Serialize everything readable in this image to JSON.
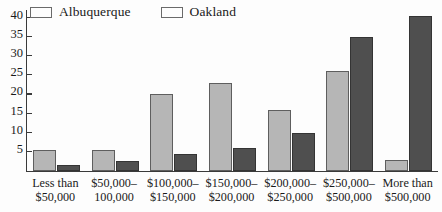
{
  "chart_data": {
    "type": "bar",
    "title": "",
    "subtitle": "",
    "xlabel": "",
    "ylabel": "",
    "ylim": [
      0,
      42
    ],
    "yticks": [
      5,
      10,
      15,
      20,
      25,
      30,
      35,
      40
    ],
    "ytick_labels": [
      "5",
      "10",
      "15",
      "20",
      "25",
      "30",
      "35",
      "40"
    ],
    "grid": false,
    "legend_position": "top-left",
    "categories": [
      "Less than\n$50,000",
      "$50,000–\n100,000",
      "$100,000–\n$150,000",
      "$150,000–\n$200,000",
      "$200,000–\n$250,000",
      "$250,000–\n$500,000",
      "More than\n$500,000"
    ],
    "category_lines": [
      [
        "Less than",
        "$50,000"
      ],
      [
        "$50,000–",
        "100,000"
      ],
      [
        "$100,000–",
        "$150,000"
      ],
      [
        "$150,000–",
        "$200,000"
      ],
      [
        "$200,000–",
        "$250,000"
      ],
      [
        "$250,000–",
        "$500,000"
      ],
      [
        "More than",
        "$500,000"
      ]
    ],
    "series": [
      {
        "name": "Albuquerque",
        "color": "#b6b6b6",
        "values": [
          5.5,
          5.5,
          20,
          23,
          16,
          26,
          3
        ]
      },
      {
        "name": "Oakland",
        "color": "#4f4f4f",
        "values": [
          1.5,
          2.5,
          4.5,
          6,
          10,
          35,
          40.5
        ]
      }
    ]
  },
  "legend": {
    "entries": [
      {
        "label": "Albuquerque",
        "swatch": "legend-swatch-albuquerque"
      },
      {
        "label": "Oakland",
        "swatch": "legend-swatch-oakland"
      }
    ]
  }
}
